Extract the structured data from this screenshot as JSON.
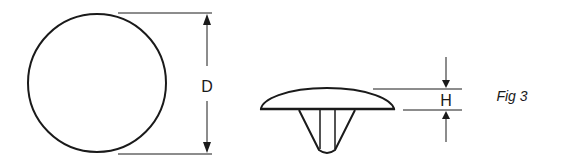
{
  "figure": {
    "caption": "Fig 3",
    "views": {
      "top_view": {
        "shape": "circle",
        "dimension_label": "D"
      },
      "side_view": {
        "shape": "domed cap with tapered stem",
        "dimension_label": "H"
      }
    }
  },
  "colors": {
    "stroke": "#1a1a1a",
    "background": "#ffffff"
  }
}
